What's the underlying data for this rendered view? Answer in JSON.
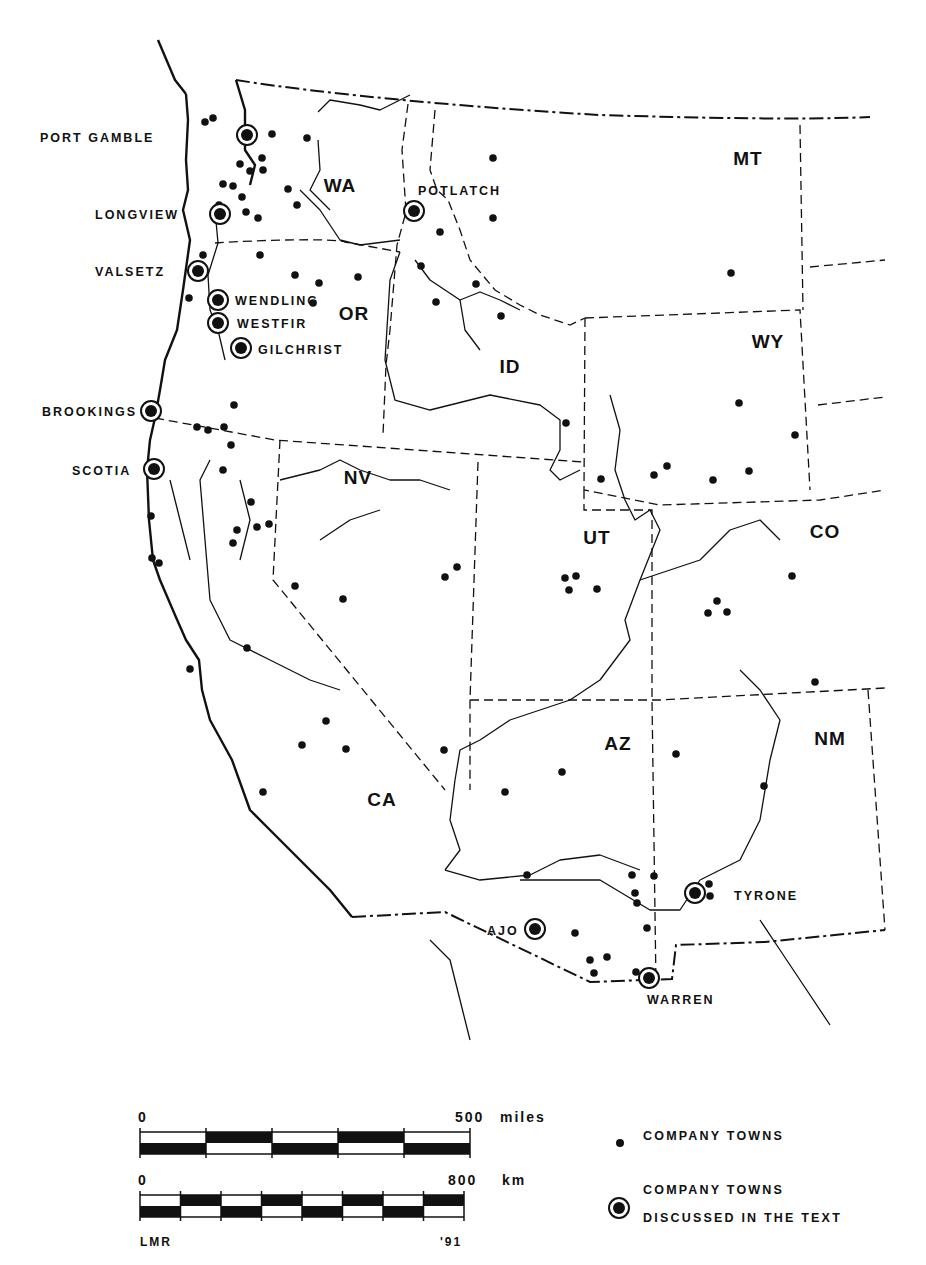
{
  "map": {
    "states": [
      {
        "abbr": "WA",
        "x": 340,
        "y": 192
      },
      {
        "abbr": "OR",
        "x": 354,
        "y": 320
      },
      {
        "abbr": "ID",
        "x": 510,
        "y": 373
      },
      {
        "abbr": "MT",
        "x": 748,
        "y": 165
      },
      {
        "abbr": "WY",
        "x": 768,
        "y": 348
      },
      {
        "abbr": "NV",
        "x": 358,
        "y": 484
      },
      {
        "abbr": "UT",
        "x": 597,
        "y": 544
      },
      {
        "abbr": "CO",
        "x": 825,
        "y": 538
      },
      {
        "abbr": "CA",
        "x": 382,
        "y": 806
      },
      {
        "abbr": "AZ",
        "x": 618,
        "y": 750
      },
      {
        "abbr": "NM",
        "x": 830,
        "y": 745
      }
    ],
    "discussed_towns": [
      {
        "name": "PORT GAMBLE",
        "x": 247,
        "y": 135,
        "lx": 40,
        "ly": 142
      },
      {
        "name": "LONGVIEW",
        "x": 220,
        "y": 214,
        "lx": 95,
        "ly": 219
      },
      {
        "name": "POTLATCH",
        "x": 414,
        "y": 211,
        "lx": 418,
        "ly": 195
      },
      {
        "name": "VALSETZ",
        "x": 198,
        "y": 271,
        "lx": 95,
        "ly": 276
      },
      {
        "name": "WENDLING",
        "x": 218,
        "y": 300,
        "lx": 235,
        "ly": 305
      },
      {
        "name": "WESTFIR",
        "x": 218,
        "y": 323,
        "lx": 237,
        "ly": 328
      },
      {
        "name": "GILCHRIST",
        "x": 241,
        "y": 348,
        "lx": 258,
        "ly": 354
      },
      {
        "name": "BROOKINGS",
        "x": 151,
        "y": 411,
        "lx": 42,
        "ly": 416
      },
      {
        "name": "SCOTIA",
        "x": 154,
        "y": 469,
        "lx": 72,
        "ly": 475
      },
      {
        "name": "AJO",
        "x": 535,
        "y": 929,
        "lx": 487,
        "ly": 935
      },
      {
        "name": "TYRONE",
        "x": 695,
        "y": 893,
        "lx": 734,
        "ly": 900
      },
      {
        "name": "WARREN",
        "x": 649,
        "y": 978,
        "lx": 647,
        "ly": 1004
      }
    ],
    "company_towns": [
      [
        205,
        122
      ],
      [
        213,
        118
      ],
      [
        272,
        134
      ],
      [
        307,
        138
      ],
      [
        240,
        164
      ],
      [
        262,
        158
      ],
      [
        250,
        171
      ],
      [
        263,
        170
      ],
      [
        223,
        184
      ],
      [
        233,
        186
      ],
      [
        219,
        205
      ],
      [
        242,
        197
      ],
      [
        246,
        212
      ],
      [
        288,
        189
      ],
      [
        297,
        205
      ],
      [
        258,
        218
      ],
      [
        295,
        275
      ],
      [
        203,
        255
      ],
      [
        260,
        255
      ],
      [
        189,
        298
      ],
      [
        319,
        283
      ],
      [
        358,
        277
      ],
      [
        313,
        303
      ],
      [
        493,
        158
      ],
      [
        493,
        218
      ],
      [
        440,
        232
      ],
      [
        421,
        266
      ],
      [
        476,
        284
      ],
      [
        436,
        302
      ],
      [
        501,
        316
      ],
      [
        731,
        273
      ],
      [
        739,
        403
      ],
      [
        795,
        435
      ],
      [
        601,
        479
      ],
      [
        654,
        475
      ],
      [
        667,
        466
      ],
      [
        713,
        480
      ],
      [
        749,
        471
      ],
      [
        234,
        405
      ],
      [
        197,
        427
      ],
      [
        208,
        430
      ],
      [
        231,
        445
      ],
      [
        224,
        427
      ],
      [
        223,
        470
      ],
      [
        251,
        502
      ],
      [
        257,
        527
      ],
      [
        237,
        530
      ],
      [
        233,
        543
      ],
      [
        269,
        524
      ],
      [
        151,
        516
      ],
      [
        152,
        558
      ],
      [
        159,
        563
      ],
      [
        190,
        669
      ],
      [
        566,
        423
      ],
      [
        565,
        578
      ],
      [
        576,
        576
      ],
      [
        569,
        590
      ],
      [
        597,
        589
      ],
      [
        295,
        586
      ],
      [
        343,
        599
      ],
      [
        445,
        577
      ],
      [
        457,
        567
      ],
      [
        247,
        648
      ],
      [
        326,
        721
      ],
      [
        302,
        745
      ],
      [
        346,
        749
      ],
      [
        263,
        792
      ],
      [
        444,
        750
      ],
      [
        717,
        601
      ],
      [
        708,
        613
      ],
      [
        727,
        612
      ],
      [
        792,
        576
      ],
      [
        815,
        682
      ],
      [
        562,
        772
      ],
      [
        505,
        792
      ],
      [
        676,
        754
      ],
      [
        764,
        786
      ],
      [
        527,
        875
      ],
      [
        632,
        875
      ],
      [
        654,
        876
      ],
      [
        635,
        893
      ],
      [
        637,
        903
      ],
      [
        709,
        884
      ],
      [
        710,
        896
      ],
      [
        647,
        928
      ],
      [
        575,
        933
      ],
      [
        590,
        960
      ],
      [
        607,
        957
      ],
      [
        594,
        973
      ],
      [
        636,
        972
      ]
    ]
  },
  "scale": {
    "miles": {
      "start": "0",
      "end": "500",
      "unit": "miles"
    },
    "km": {
      "start": "0",
      "end": "800",
      "unit": "km"
    },
    "credit_left": "LMR",
    "credit_right": "'91"
  },
  "legend": {
    "items": [
      {
        "symbol": "dot",
        "label": "COMPANY TOWNS"
      },
      {
        "symbol": "ringed-dot",
        "label_line1": "COMPANY TOWNS",
        "label_line2": "DISCUSSED IN THE TEXT"
      }
    ]
  }
}
